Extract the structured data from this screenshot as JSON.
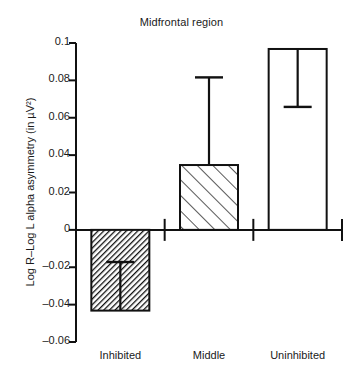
{
  "chart_data": {
    "type": "bar",
    "title": "Midfrontal region",
    "xlabel": "",
    "ylabel": "Log R–Log L alpha asymmetry (in µV²)",
    "categories": [
      "Inhibited",
      "Middle",
      "Uninhibited"
    ],
    "values": [
      -0.0432,
      0.0347,
      0.0968
    ],
    "errors_absolute": [
      -0.0172,
      0.0816,
      0.0658
    ],
    "series": [
      {
        "name": "Alpha asymmetry",
        "values": [
          -0.0432,
          0.0347,
          0.0968
        ]
      }
    ],
    "bar_styles": [
      "dense-backslash-hatch",
      "sparse-forwardslash-hatch",
      "open-white"
    ],
    "ylim": [
      -0.06,
      0.1
    ],
    "ytick_values": [
      0.1,
      0.08,
      0.06,
      0.04,
      0.02,
      0,
      -0.02,
      -0.04,
      -0.06
    ],
    "ytick_labels": [
      "0.1",
      "0.08",
      "0.06",
      "0.04",
      "0.02",
      "0",
      "–0.02",
      "–0.04",
      "–0.06"
    ],
    "grid": false,
    "legend": "none",
    "baseline_value": 0,
    "error_bar_note": "Error bar whisker extends from bar top toward zero-ward cap value",
    "colors": {
      "axis": "#111111",
      "bar_outline": "#111111",
      "bar_fill": "#ffffff",
      "text": "#1a1a1a",
      "background": "#ffffff"
    }
  }
}
